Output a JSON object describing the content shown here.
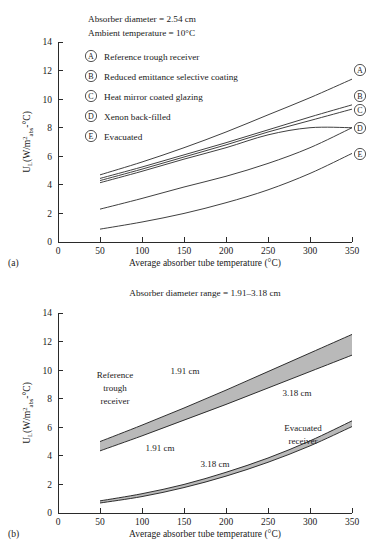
{
  "figure": {
    "panel_a_label": "(a)",
    "panel_b_label": "(b)"
  },
  "chart_data": [
    {
      "id": "panel-a",
      "type": "line",
      "title": "",
      "notes": [
        "Absorber diameter = 2.54 cm",
        "Ambient temperature = 10°C"
      ],
      "xlabel": "Average absorber tube temperature (°C)",
      "ylabel": "U_L (W/m²_abs-°C)",
      "ylabel_parts": {
        "main1": "U",
        "sub1": "L",
        "main2": "(W/m",
        "sup": "2",
        "sub2": "abs",
        "main3": "-°C)"
      },
      "xlim": [
        0,
        350
      ],
      "ylim": [
        0,
        14
      ],
      "xticks": [
        0,
        50,
        100,
        150,
        200,
        250,
        300,
        350
      ],
      "yticks": [
        0,
        2,
        4,
        6,
        8,
        10,
        12,
        14
      ],
      "grid": false,
      "legend_position": "inside-top-left",
      "legend": [
        {
          "key": "A",
          "label": "Reference trough receiver"
        },
        {
          "key": "B",
          "label": "Reduced emittance selective coating"
        },
        {
          "key": "C",
          "label": "Heat mirror coated glazing"
        },
        {
          "key": "D",
          "label": "Xenon back-filled"
        },
        {
          "key": "E",
          "label": "Evacuated"
        }
      ],
      "end_labels": [
        "A",
        "B",
        "C",
        "D",
        "E"
      ],
      "x": [
        50,
        100,
        150,
        200,
        250,
        300,
        350
      ],
      "series": [
        {
          "name": "A",
          "label": "Reference trough receiver",
          "values": [
            4.7,
            5.6,
            6.6,
            7.7,
            8.9,
            10.1,
            11.4
          ]
        },
        {
          "name": "B",
          "label": "Reduced emittance selective coating",
          "values": [
            4.45,
            5.25,
            6.1,
            6.95,
            7.85,
            8.75,
            9.6
          ]
        },
        {
          "name": "C",
          "label": "Heat mirror coated glazing",
          "values": [
            4.3,
            5.1,
            5.95,
            6.8,
            7.7,
            8.5,
            9.3
          ]
        },
        {
          "name": "D",
          "label": "Xenon back-filled",
          "values": [
            4.15,
            4.95,
            5.8,
            6.6,
            7.5,
            8.0,
            8.0
          ]
        },
        {
          "name": "D2",
          "label": "Xenon back-filled lower",
          "values": [
            2.3,
            3.05,
            3.85,
            4.6,
            5.5,
            6.6,
            8.0
          ]
        },
        {
          "name": "E",
          "label": "Evacuated",
          "values": [
            0.9,
            1.4,
            2.0,
            2.75,
            3.65,
            4.8,
            6.2
          ]
        }
      ]
    },
    {
      "id": "panel-b",
      "type": "area",
      "title": "Absorber diameter range = 1.91–3.18 cm",
      "notes": [
        "Absorber diameter range = 1.91–3.18 cm"
      ],
      "xlabel": "Average absorber tube temperature (°C)",
      "ylabel": "U_L (W/m²_abs-°C)",
      "ylabel_parts": {
        "main1": "U",
        "sub1": "L",
        "main2": "(W/m",
        "sup": "2",
        "sub2": "abs",
        "main3": "-°C)"
      },
      "xlim": [
        0,
        350
      ],
      "ylim": [
        0,
        14
      ],
      "xticks": [
        0,
        50,
        100,
        150,
        200,
        250,
        300,
        350
      ],
      "yticks": [
        0,
        2,
        4,
        6,
        8,
        10,
        12,
        14
      ],
      "grid": false,
      "band_fill": "#b9b9b9",
      "x": [
        50,
        100,
        150,
        200,
        250,
        300,
        350
      ],
      "bands": [
        {
          "name": "Reference trough receiver",
          "label": "Reference trough receiver",
          "label_lines": [
            "Reference",
            "trough",
            "receiver"
          ],
          "upper_label": "1.91 cm",
          "lower_label": "3.18 cm",
          "upper": [
            5.0,
            6.15,
            7.35,
            8.6,
            9.9,
            11.2,
            12.5
          ],
          "lower": [
            4.35,
            5.4,
            6.5,
            7.6,
            8.75,
            9.9,
            11.05
          ]
        },
        {
          "name": "Evacuated receiver",
          "label": "Evacuated receiver",
          "label_lines": [
            "Evacuated",
            "receiver"
          ],
          "upper_label": "1.91 cm",
          "lower_label": "3.18 cm",
          "upper": [
            0.85,
            1.35,
            2.0,
            2.85,
            3.85,
            5.05,
            6.45
          ],
          "lower": [
            0.7,
            1.15,
            1.78,
            2.58,
            3.55,
            4.7,
            6.05
          ]
        }
      ],
      "annotations": [
        {
          "text": "Reference trough receiver",
          "x": 95,
          "y": 9.0
        },
        {
          "text": "1.91 cm",
          "x": 150,
          "y": 9.8
        },
        {
          "text": "3.18 cm",
          "x": 283,
          "y": 8.3
        },
        {
          "text": "Evacuated receiver",
          "x": 295,
          "y": 4.3
        },
        {
          "text": "1.91 cm",
          "x": 125,
          "y": 2.7
        },
        {
          "text": "3.18 cm",
          "x": 192,
          "y": 1.9
        }
      ]
    }
  ]
}
